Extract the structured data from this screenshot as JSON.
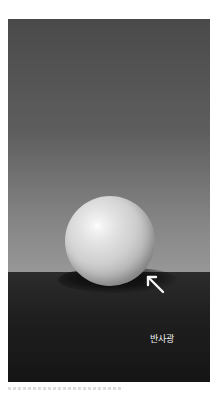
{
  "image": {
    "description": "Rendered white sphere on dark floor against gradient gray wall",
    "annotation": {
      "label": "반사광",
      "arrow": "arrow-up-left-icon"
    },
    "colors": {
      "wall_top": "#4a4a4a",
      "wall_bottom": "#979797",
      "floor": "#1f1f1f",
      "ball_highlight": "#ffffff",
      "ball_mid": "#cfcfcf",
      "label": "#f0f0f0"
    }
  }
}
